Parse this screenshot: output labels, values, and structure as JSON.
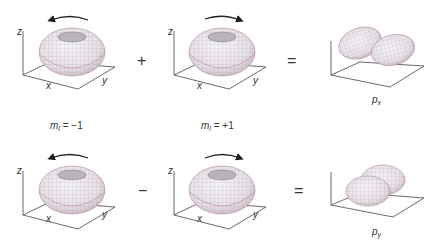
{
  "rows": [
    {
      "left": {
        "axes": {
          "z": "z",
          "x": "x",
          "y": "y"
        },
        "rotation": "counterclockwise"
      },
      "operator": "+",
      "right": {
        "axes": {
          "z": "z",
          "x": "x",
          "y": "y"
        },
        "rotation": "clockwise"
      },
      "equals": "=",
      "result": {
        "label_main": "p",
        "label_sub": "x",
        "shape": "two-lobe p orbital along x"
      }
    },
    {
      "left": {
        "axes": {
          "z": "z",
          "x": "x",
          "y": "y"
        },
        "rotation": "counterclockwise"
      },
      "operator": "−",
      "right": {
        "axes": {
          "z": "z",
          "x": "x",
          "y": "y"
        },
        "rotation": "clockwise"
      },
      "equals": "=",
      "result": {
        "label_main": "p",
        "label_sub": "y",
        "shape": "two-lobe p orbital along y"
      }
    }
  ],
  "quantum_labels": [
    {
      "symbol": "m",
      "sub": "l",
      "value": " = −1"
    },
    {
      "symbol": "m",
      "sub": "l",
      "value": " = +1"
    }
  ],
  "colors": {
    "torus_fill": "#ece6ec",
    "mesh": "#8a8a96",
    "rim": "#c07a88",
    "axis": "#444444"
  }
}
